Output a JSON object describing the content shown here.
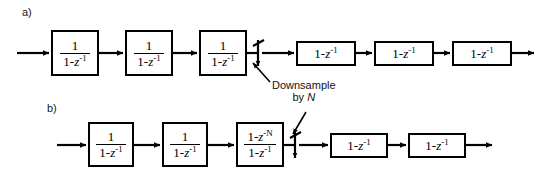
{
  "figure": {
    "background": "#ffffff",
    "line_color": "#000000",
    "width": 540,
    "height": 186
  },
  "rows": [
    {
      "id": "a",
      "label": "a)",
      "label_x": 22,
      "label_y": 6,
      "baseline_y": 53,
      "input_arrow": {
        "x1": 18,
        "x2": 50
      },
      "output_arrow": {
        "x1": 510,
        "x2": 534
      },
      "downsampler": {
        "x": 258,
        "label": "downsample-switch"
      },
      "blocks": [
        {
          "kind": "integrator",
          "numerator": "1",
          "denominator": "1-z",
          "den_exp": "-1",
          "x": 51,
          "y": 30,
          "w": 48,
          "h": 46
        },
        {
          "kind": "integrator",
          "numerator": "1",
          "denominator": "1-z",
          "den_exp": "-1",
          "x": 125,
          "y": 30,
          "w": 48,
          "h": 46
        },
        {
          "kind": "integrator",
          "numerator": "1",
          "denominator": "1-z",
          "den_exp": "-1",
          "x": 199,
          "y": 30,
          "w": 48,
          "h": 46
        },
        {
          "kind": "differentiator",
          "expr": "1-z",
          "exp": "-1",
          "x": 296,
          "y": 41,
          "w": 60,
          "h": 25
        },
        {
          "kind": "differentiator",
          "expr": "1-z",
          "exp": "-1",
          "x": 374,
          "y": 41,
          "w": 60,
          "h": 25
        },
        {
          "kind": "differentiator",
          "expr": "1-z",
          "exp": "-1",
          "x": 452,
          "y": 41,
          "w": 60,
          "h": 25
        }
      ]
    },
    {
      "id": "b",
      "label": "b)",
      "label_x": 47,
      "label_y": 102,
      "baseline_y": 145,
      "input_arrow": {
        "x1": 58,
        "x2": 87
      },
      "output_arrow": {
        "x1": 466,
        "x2": 492
      },
      "downsampler": {
        "x": 295,
        "label": "downsample-switch"
      },
      "blocks": [
        {
          "kind": "integrator",
          "numerator": "1",
          "denominator": "1-z",
          "den_exp": "-1",
          "x": 88,
          "y": 122,
          "w": 46,
          "h": 45
        },
        {
          "kind": "integrator",
          "numerator": "1",
          "denominator": "1-z",
          "den_exp": "-1",
          "x": 162,
          "y": 122,
          "w": 46,
          "h": 45
        },
        {
          "kind": "comb",
          "numerator": "1-z",
          "num_exp": "-N",
          "denominator": "1-z",
          "den_exp": "-1",
          "x": 236,
          "y": 122,
          "w": 48,
          "h": 45
        },
        {
          "kind": "differentiator",
          "expr": "1-z",
          "exp": "-1",
          "x": 330,
          "y": 133,
          "w": 58,
          "h": 25
        },
        {
          "kind": "differentiator",
          "expr": "1-z",
          "exp": "-1",
          "x": 408,
          "y": 133,
          "w": 58,
          "h": 25
        }
      ]
    }
  ],
  "annotation": {
    "line1": "Downsample",
    "line2_prefix": "by ",
    "line2_var": "N",
    "x": 260,
    "y": 82,
    "leader_a": {
      "x1": 268,
      "y1": 80,
      "x2": 252,
      "y2": 62
    },
    "leader_b": {
      "x1": 304,
      "y1": 112,
      "x2": 292,
      "y2": 136
    }
  }
}
